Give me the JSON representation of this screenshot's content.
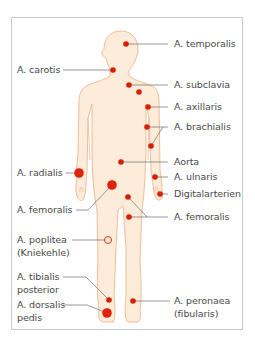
{
  "diagram": {
    "title": "",
    "colors": {
      "body_fill": "#fdecd9",
      "body_outline": "#f0b58c",
      "pulse_point": "#d81e05",
      "leader_line": "#6b6b6b",
      "label_text": "#4a4a4a",
      "frame_border": "#c8c8c8"
    },
    "labels": {
      "temporalis": "A. temporalis",
      "carotis": "A. carotis",
      "subclavia": "A. subclavia",
      "axillaris": "A. axillaris",
      "brachialis": "A. brachialis",
      "aorta": "Aorta",
      "radialis": "A. radialis",
      "ulnaris": "A. ulnaris",
      "digital": "Digitalarterien",
      "femoralis_left": "A. femoralis",
      "femoralis_right": "A. femoralis",
      "poplitea_1": "A. poplitea",
      "poplitea_2": "(Kniekehle)",
      "tibialis_1": "A. tibialis",
      "tibialis_2": "posterior",
      "dorsalis_1": "A. dorsalis",
      "dorsalis_2": "pedis",
      "peronaea_1": "A. peronaea",
      "peronaea_2": "(fibularis)"
    },
    "pulse_points": [
      {
        "name": "temporalis",
        "x": 126,
        "y": 44,
        "r": 2.8
      },
      {
        "name": "carotis",
        "x": 113,
        "y": 70,
        "r": 2.8
      },
      {
        "name": "subclavia",
        "x": 129,
        "y": 85,
        "r": 2.8
      },
      {
        "name": "subclavia-2",
        "x": 139,
        "y": 92,
        "r": 2.8
      },
      {
        "name": "axillaris",
        "x": 148,
        "y": 107,
        "r": 2.8
      },
      {
        "name": "brachialis-1",
        "x": 147,
        "y": 127,
        "r": 2.8
      },
      {
        "name": "brachialis-2",
        "x": 151,
        "y": 146,
        "r": 2.8
      },
      {
        "name": "aorta",
        "x": 121,
        "y": 162,
        "r": 2.8
      },
      {
        "name": "radialis",
        "x": 79,
        "y": 173,
        "r": 4.8
      },
      {
        "name": "ulnaris",
        "x": 155,
        "y": 177,
        "r": 2.8
      },
      {
        "name": "femoralis-left",
        "x": 112,
        "y": 185,
        "r": 4.8
      },
      {
        "name": "digital",
        "x": 160,
        "y": 194,
        "r": 2.8
      },
      {
        "name": "femoralis-right-1",
        "x": 128,
        "y": 197,
        "r": 2.8
      },
      {
        "name": "femoralis-right-2",
        "x": 129,
        "y": 217,
        "r": 2.8
      },
      {
        "name": "poplitea",
        "x": 108,
        "y": 240,
        "r": 3.5,
        "hollow": true
      },
      {
        "name": "tibialis",
        "x": 109,
        "y": 300,
        "r": 2.8
      },
      {
        "name": "peronaea",
        "x": 133,
        "y": 301,
        "r": 2.8
      },
      {
        "name": "dorsalis",
        "x": 107,
        "y": 313,
        "r": 4.8
      }
    ]
  }
}
